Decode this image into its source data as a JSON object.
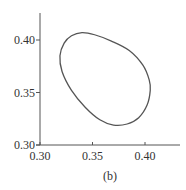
{
  "chart_data": {
    "type": "line",
    "title": "",
    "caption": "(b)",
    "xlabel": "",
    "ylabel": "",
    "xlim": [
      0.3,
      0.43
    ],
    "ylim": [
      0.3,
      0.425
    ],
    "x_ticks": [
      "0.30",
      "0.35",
      "0.40"
    ],
    "y_ticks": [
      "0.30",
      "0.35",
      "0.40"
    ],
    "grid": false,
    "legend": null,
    "series": [
      {
        "name": "closed-orbit",
        "closed": true,
        "points": [
          [
            0.34,
            0.407
          ],
          [
            0.352,
            0.405
          ],
          [
            0.368,
            0.399
          ],
          [
            0.385,
            0.39
          ],
          [
            0.398,
            0.376
          ],
          [
            0.404,
            0.362
          ],
          [
            0.405,
            0.352
          ],
          [
            0.402,
            0.338
          ],
          [
            0.394,
            0.326
          ],
          [
            0.383,
            0.32
          ],
          [
            0.37,
            0.319
          ],
          [
            0.357,
            0.324
          ],
          [
            0.343,
            0.336
          ],
          [
            0.33,
            0.352
          ],
          [
            0.321,
            0.37
          ],
          [
            0.319,
            0.385
          ],
          [
            0.323,
            0.397
          ],
          [
            0.33,
            0.404
          ]
        ]
      }
    ]
  },
  "colors": {
    "axis": "#555555",
    "curve": "#555555",
    "text": "#333333"
  }
}
